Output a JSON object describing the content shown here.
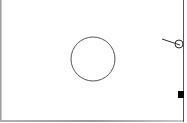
{
  "canvas": {
    "background": "#ffffff",
    "stroke_color": "#555555",
    "fill_color": "#000000"
  },
  "shapes": {
    "main_circle": {
      "cx": 93,
      "cy": 59,
      "r": 22
    },
    "small_circle": {
      "cx": 179,
      "cy": 44,
      "r": 4
    },
    "pointer_line": {
      "x1": 162,
      "y1": 39,
      "x2": 180,
      "y2": 45
    },
    "square_marker": {
      "x": 178,
      "y": 91,
      "w": 6,
      "h": 7
    }
  }
}
